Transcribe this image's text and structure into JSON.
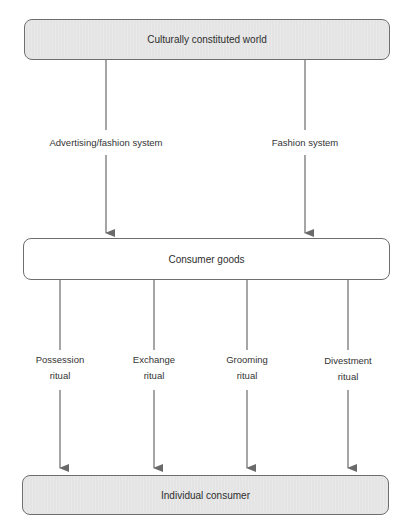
{
  "diagram": {
    "nodes": {
      "top": {
        "label": "Culturally constituted world",
        "style": "shaded"
      },
      "middle": {
        "label": "Consumer goods",
        "style": "plain"
      },
      "bottom": {
        "label": "Individual consumer",
        "style": "shaded"
      }
    },
    "upper_edges": [
      {
        "label": "Advertising/fashion system",
        "from": "top",
        "to": "middle"
      },
      {
        "label": "Fashion system",
        "from": "top",
        "to": "middle"
      }
    ],
    "lower_edges": [
      {
        "label_line1": "Possession",
        "label_line2": "ritual",
        "from": "middle",
        "to": "bottom"
      },
      {
        "label_line1": "Exchange",
        "label_line2": "ritual",
        "from": "middle",
        "to": "bottom"
      },
      {
        "label_line1": "Grooming",
        "label_line2": "ritual",
        "from": "middle",
        "to": "bottom"
      },
      {
        "label_line1": "Divestment",
        "label_line2": "ritual",
        "from": "middle",
        "to": "bottom"
      }
    ],
    "colors": {
      "box_border": "#6e6e6e",
      "shaded_fill": "#e4e4e4",
      "plain_fill": "#ffffff",
      "arrow": "#6a6a6a"
    }
  }
}
